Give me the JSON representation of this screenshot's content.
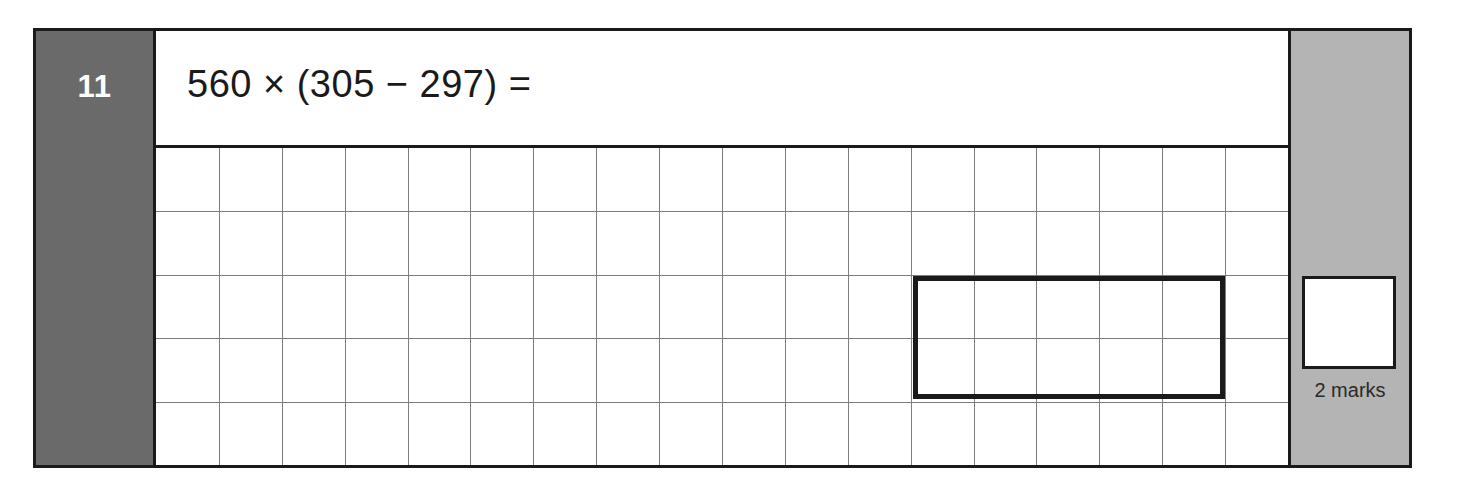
{
  "sheet": {
    "kind": "maths-exam-question"
  },
  "question": {
    "number": "11",
    "text": "560 × (305 − 297) =",
    "operands": {
      "multiplier": "560",
      "minuend": "305",
      "subtrahend": "297"
    }
  },
  "working_area": {
    "columns": 18,
    "rows": 5,
    "answer_box": {
      "label": "",
      "value": "",
      "spans_columns": 5,
      "spans_rows": 2
    }
  },
  "marks": {
    "label": "2 marks",
    "count": "2",
    "score_value": ""
  },
  "colors": {
    "number_column": "#6a6a6a",
    "marks_column": "#b4b4b4",
    "ink": "#1a1a1a",
    "grid_line": "#7d7d7d",
    "paper": "#ffffff"
  }
}
